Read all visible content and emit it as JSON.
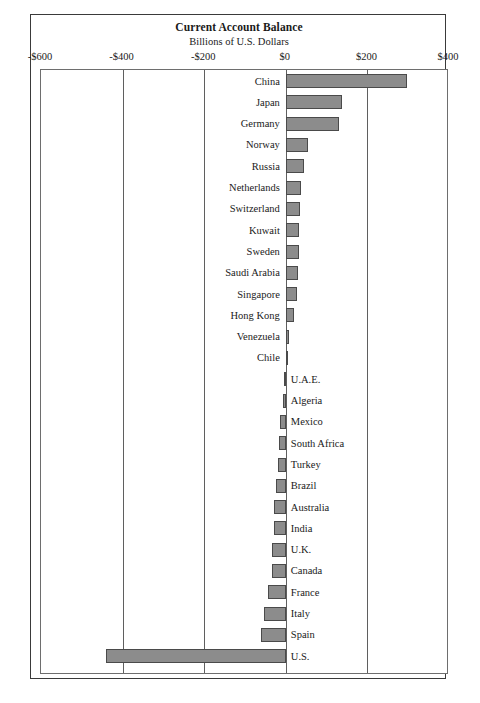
{
  "chart_data": {
    "type": "bar",
    "orientation": "horizontal",
    "title": "Current Account Balance",
    "subtitle": "Billions of U.S. Dollars",
    "xlabel": "",
    "ylabel": "",
    "xlim": [
      -600,
      400
    ],
    "xticks": [
      -600,
      -400,
      -200,
      0,
      200,
      400
    ],
    "xtick_labels": [
      "-$600",
      "-$400",
      "-$200",
      "$0",
      "$200",
      "$400"
    ],
    "grid": true,
    "legend": null,
    "bar_color": "#8c8c8c",
    "bar_edge_color": "#4a4a4a",
    "categories": [
      "China",
      "Japan",
      "Germany",
      "Norway",
      "Russia",
      "Netherlands",
      "Switzerland",
      "Kuwait",
      "Sweden",
      "Saudi Arabia",
      "Singapore",
      "Hong Kong",
      "Venezuela",
      "Chile",
      "U.A.E.",
      "Algeria",
      "Mexico",
      "South Africa",
      "Turkey",
      "Brazil",
      "Australia",
      "India",
      "U.K.",
      "Canada",
      "France",
      "Italy",
      "Spain",
      "U.S."
    ],
    "values": [
      297,
      138,
      130,
      55,
      44,
      38,
      34,
      33,
      32,
      30,
      27,
      20,
      9,
      3,
      -5,
      -7,
      -13,
      -16,
      -18,
      -24,
      -30,
      -30,
      -33,
      -34,
      -44,
      -53,
      -60,
      -440
    ],
    "bars": [
      {
        "label": "China",
        "value": 297,
        "label_side": "left"
      },
      {
        "label": "Japan",
        "value": 138,
        "label_side": "left"
      },
      {
        "label": "Germany",
        "value": 130,
        "label_side": "left"
      },
      {
        "label": "Norway",
        "value": 55,
        "label_side": "left"
      },
      {
        "label": "Russia",
        "value": 44,
        "label_side": "left"
      },
      {
        "label": "Netherlands",
        "value": 38,
        "label_side": "left"
      },
      {
        "label": "Switzerland",
        "value": 34,
        "label_side": "left"
      },
      {
        "label": "Kuwait",
        "value": 33,
        "label_side": "left"
      },
      {
        "label": "Sweden",
        "value": 32,
        "label_side": "left"
      },
      {
        "label": "Saudi Arabia",
        "value": 30,
        "label_side": "left"
      },
      {
        "label": "Singapore",
        "value": 27,
        "label_side": "left"
      },
      {
        "label": "Hong Kong",
        "value": 20,
        "label_side": "left"
      },
      {
        "label": "Venezuela",
        "value": 9,
        "label_side": "left"
      },
      {
        "label": "Chile",
        "value": 3,
        "label_side": "left"
      },
      {
        "label": "U.A.E.",
        "value": -5,
        "label_side": "right"
      },
      {
        "label": "Algeria",
        "value": -7,
        "label_side": "right"
      },
      {
        "label": "Mexico",
        "value": -13,
        "label_side": "right"
      },
      {
        "label": "South Africa",
        "value": -16,
        "label_side": "right"
      },
      {
        "label": "Turkey",
        "value": -18,
        "label_side": "right"
      },
      {
        "label": "Brazil",
        "value": -24,
        "label_side": "right"
      },
      {
        "label": "Australia",
        "value": -30,
        "label_side": "right"
      },
      {
        "label": "India",
        "value": -30,
        "label_side": "right"
      },
      {
        "label": "U.K.",
        "value": -33,
        "label_side": "right"
      },
      {
        "label": "Canada",
        "value": -34,
        "label_side": "right"
      },
      {
        "label": "France",
        "value": -44,
        "label_side": "right"
      },
      {
        "label": "Italy",
        "value": -53,
        "label_side": "right"
      },
      {
        "label": "Spain",
        "value": -60,
        "label_side": "right"
      },
      {
        "label": "U.S.",
        "value": -440,
        "label_side": "right"
      }
    ]
  }
}
